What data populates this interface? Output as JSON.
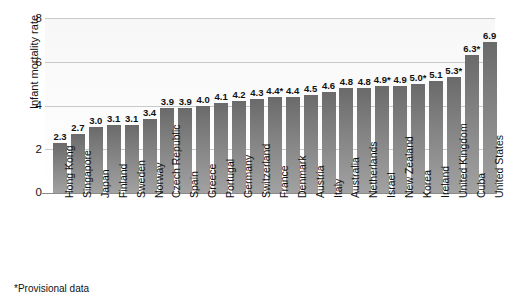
{
  "chart_data": {
    "type": "bar",
    "title": "",
    "xlabel": "",
    "ylabel": "Infant mortality rate",
    "ylim": [
      0,
      8
    ],
    "ytick_labels": [
      "8",
      "6",
      "4",
      "2",
      "0"
    ],
    "ytick_values": [
      8,
      6,
      4,
      2,
      0
    ],
    "grid": true,
    "legend": null,
    "orientation": "vertical",
    "bar_color": "#777777",
    "categories": [
      "Hong Kong",
      "Singapore",
      "Japan",
      "Finland",
      "Sweden",
      "Norway",
      "Czech Republic",
      "Spain",
      "Greece",
      "Portugal",
      "Germany",
      "Switzerland",
      "France",
      "Denmark",
      "Austria",
      "Italy",
      "Australia",
      "Netherlands",
      "Israel",
      "New Zealand",
      "Korea",
      "Ireland",
      "United Kingdom",
      "Cuba",
      "United States"
    ],
    "values": [
      2.3,
      2.7,
      3.0,
      3.1,
      3.1,
      3.4,
      3.9,
      3.9,
      4.0,
      4.1,
      4.2,
      4.3,
      4.4,
      4.4,
      4.5,
      4.6,
      4.8,
      4.8,
      4.9,
      4.9,
      5.0,
      5.1,
      5.3,
      6.3,
      6.9
    ],
    "data_labels": [
      "2.3",
      "2.7",
      "3.0",
      "3.1",
      "3.1",
      "3.4",
      "3.9",
      "3.9",
      "4.0",
      "4.1",
      "4.2",
      "4.3",
      "4.4*",
      "4.4",
      "4.5",
      "4.6",
      "4.8",
      "4.8",
      "4.9*",
      "4.9",
      "5.0*",
      "5.1",
      "5.3*",
      "6.3*",
      "6.9"
    ],
    "provisional": [
      false,
      false,
      false,
      false,
      false,
      false,
      false,
      false,
      false,
      false,
      false,
      false,
      true,
      false,
      false,
      false,
      false,
      false,
      true,
      false,
      true,
      false,
      true,
      true,
      false
    ],
    "annotations": [
      "*Provisional data"
    ]
  },
  "footnote": "*Provisional data"
}
